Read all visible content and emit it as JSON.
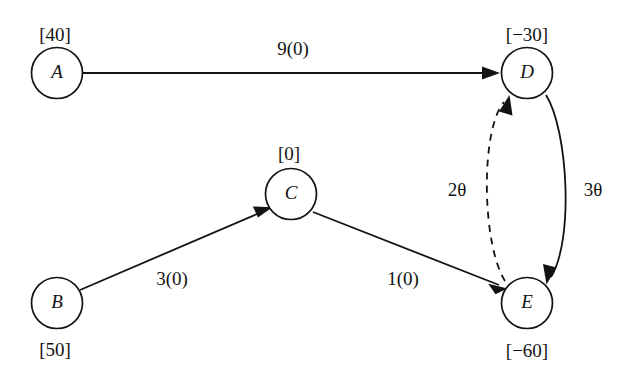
{
  "diagram": {
    "type": "network-flow-graph",
    "background_color": "#ffffff",
    "stroke_color": "#131313",
    "nodes": [
      {
        "id": "A",
        "label": "A",
        "supply_label": "[40]",
        "supply_value": 40,
        "cx": 57,
        "cy": 73,
        "r": 25.5,
        "supply_position": "above"
      },
      {
        "id": "B",
        "label": "B",
        "supply_label": "[50]",
        "supply_value": 50,
        "cx": 57,
        "cy": 303,
        "r": 25.5,
        "supply_position": "below"
      },
      {
        "id": "C",
        "label": "C",
        "supply_label": "[0]",
        "supply_value": 0,
        "cx": 291,
        "cy": 194,
        "r": 25.5,
        "supply_position": "above"
      },
      {
        "id": "D",
        "label": "D",
        "supply_label": "[−30]",
        "supply_value": -30,
        "cx": 527,
        "cy": 73,
        "r": 25.5,
        "supply_position": "above"
      },
      {
        "id": "E",
        "label": "E",
        "supply_label": "[−60]",
        "supply_value": -60,
        "cx": 527,
        "cy": 303,
        "r": 25.5,
        "supply_position": "below"
      }
    ],
    "edges": [
      {
        "id": "A-D",
        "from": "A",
        "to": "D",
        "label": "9(0)",
        "cost": 9,
        "flow": 0,
        "style": "solid",
        "shape": "straight",
        "label_x": 293,
        "label_y": 55
      },
      {
        "id": "B-C",
        "from": "B",
        "to": "C",
        "label": "3(0)",
        "cost": 3,
        "flow": 0,
        "style": "solid",
        "shape": "straight",
        "label_x": 172,
        "label_y": 285
      },
      {
        "id": "C-E",
        "from": "C",
        "to": "E",
        "label": "1(0)",
        "cost": 1,
        "flow": 0,
        "style": "solid",
        "shape": "straight",
        "label_x": 403,
        "label_y": 285
      },
      {
        "id": "D-E",
        "from": "D",
        "to": "E",
        "label": "3θ",
        "coefficient": 3,
        "style": "solid",
        "shape": "curve-right",
        "label_x": 593,
        "label_y": 196
      },
      {
        "id": "E-D",
        "from": "E",
        "to": "D",
        "label": "2θ",
        "coefficient": 2,
        "style": "dashed",
        "shape": "curve-left",
        "label_x": 457,
        "label_y": 196
      }
    ]
  }
}
